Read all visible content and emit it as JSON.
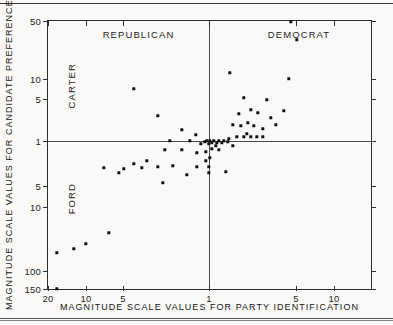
{
  "figure": {
    "background_color": "#faf9f7",
    "ink_color": "#111111"
  },
  "chart_data": {
    "type": "scatter",
    "title": "",
    "xlabel": "MAGNITUDE SCALE VALUES FOR PARTY IDENTIFICATION",
    "ylabel": "MAGNITUDE SCALE VALUES FOR CANDIDATE PREFERENCE",
    "grid": false,
    "legend_position": "none",
    "x_axis": {
      "scale": "log-mirrored",
      "tick_labels": [
        "20",
        "10",
        "5",
        "1",
        "5",
        "10"
      ],
      "tick_positions_px": [
        47,
        85,
        122,
        208,
        295,
        333
      ],
      "left_half_label": "REPUBLICAN",
      "right_half_label": "DEMOCRAT",
      "center_px": 208
    },
    "y_axis": {
      "scale": "log-mirrored",
      "tick_labels": [
        "50",
        "10",
        "5",
        "1",
        "5",
        "10",
        "100",
        "150"
      ],
      "tick_positions_px": [
        20,
        78,
        98,
        140,
        185,
        206,
        270,
        288
      ],
      "upper_half_label": "CARTER",
      "lower_half_label": "FORD",
      "center_px": 140
    },
    "point_count": 71,
    "points_px": [
      [
        290,
        21
      ],
      [
        296,
        39
      ],
      [
        229,
        72
      ],
      [
        288,
        78
      ],
      [
        133,
        88
      ],
      [
        250,
        109
      ],
      [
        157,
        115
      ],
      [
        246,
        133
      ],
      [
        257,
        112
      ],
      [
        266,
        99
      ],
      [
        232,
        124
      ],
      [
        240,
        125
      ],
      [
        270,
        117
      ],
      [
        181,
        129
      ],
      [
        195,
        134
      ],
      [
        236,
        136
      ],
      [
        243,
        136
      ],
      [
        250,
        136
      ],
      [
        256,
        136
      ],
      [
        262,
        136
      ],
      [
        228,
        138
      ],
      [
        169,
        140
      ],
      [
        189,
        140
      ],
      [
        206,
        140
      ],
      [
        209,
        140
      ],
      [
        213,
        140
      ],
      [
        218,
        140
      ],
      [
        223,
        140
      ],
      [
        227,
        141
      ],
      [
        204,
        141
      ],
      [
        211,
        142
      ],
      [
        216,
        142
      ],
      [
        221,
        142
      ],
      [
        208,
        143
      ],
      [
        232,
        145
      ],
      [
        211,
        148
      ],
      [
        164,
        149
      ],
      [
        181,
        149
      ],
      [
        218,
        149
      ],
      [
        205,
        151
      ],
      [
        103,
        167
      ],
      [
        123,
        168
      ],
      [
        141,
        167
      ],
      [
        157,
        166
      ],
      [
        172,
        165
      ],
      [
        196,
        166
      ],
      [
        208,
        166
      ],
      [
        205,
        160
      ],
      [
        118,
        172
      ],
      [
        186,
        174
      ],
      [
        225,
        171
      ],
      [
        162,
        182
      ],
      [
        208,
        172
      ],
      [
        108,
        232
      ],
      [
        85,
        243
      ],
      [
        73,
        248
      ],
      [
        56,
        252
      ],
      [
        56,
        288
      ],
      [
        243,
        97
      ],
      [
        238,
        113
      ],
      [
        247,
        122
      ],
      [
        253,
        125
      ],
      [
        262,
        128
      ],
      [
        275,
        124
      ],
      [
        283,
        110
      ],
      [
        200,
        143
      ],
      [
        215,
        145
      ],
      [
        196,
        152
      ],
      [
        209,
        157
      ],
      [
        146,
        160
      ],
      [
        133,
        163
      ]
    ]
  },
  "annotations": {
    "quadrant_left": "REPUBLICAN",
    "quadrant_right": "DEMOCRAT",
    "side_upper": "CARTER",
    "side_lower": "FORD"
  }
}
